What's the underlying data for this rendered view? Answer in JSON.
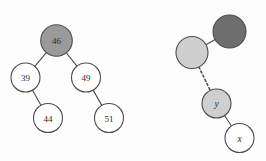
{
  "figure": {
    "background_color": "#fdfdfd",
    "stroke_color": "#4d4d4d",
    "fill_colors": {
      "white": "#ffffff",
      "light_gray": "#cfcfcf",
      "mid_gray": "#9a9a9a",
      "dark_gray": "#6e6e6e"
    }
  },
  "diagrams": [
    {
      "name": "left-tree",
      "kind": "binary-search-tree",
      "nodes": [
        {
          "id": "n46",
          "label": "46",
          "cx": 56.5,
          "cy": 40.5,
          "r": 15.8,
          "fill": "#9a9a9a",
          "label_fill": "#3a3a3a"
        },
        {
          "id": "n39",
          "label": "39",
          "cx": 25.5,
          "cy": 77.5,
          "r": 14.5,
          "fill": "#ffffff",
          "label_fill": "#2b2b2b"
        },
        {
          "id": "n49",
          "label": "49",
          "cx": 86.0,
          "cy": 77.5,
          "r": 14.5,
          "fill": "#ffffff",
          "label_fill": "#2b2b2b"
        },
        {
          "id": "n44",
          "label": "44",
          "cx": 48.0,
          "cy": 118.0,
          "r": 14.5,
          "fill": "#ffffff",
          "label_fill": "#2b2b2b"
        },
        {
          "id": "n51",
          "label": "51",
          "cx": 109.0,
          "cy": 118.0,
          "r": 14.5,
          "fill": "#ffffff",
          "label_fill": "#2b2b2b"
        }
      ],
      "edges": [
        {
          "from": "n46",
          "to": "n39",
          "style": "solid"
        },
        {
          "from": "n46",
          "to": "n49",
          "style": "solid"
        },
        {
          "from": "n39",
          "to": "n44",
          "style": "solid"
        },
        {
          "from": "n49",
          "to": "n51",
          "style": "solid"
        }
      ]
    },
    {
      "name": "right-tree",
      "kind": "abstract-subtree",
      "nodes": [
        {
          "id": "rdark",
          "label": "",
          "cx": 229.5,
          "cy": 31.5,
          "r": 16.5,
          "fill": "#6e6e6e",
          "label_fill": "#2b2b2b"
        },
        {
          "id": "rlight",
          "label": "",
          "cx": 192.0,
          "cy": 52.5,
          "r": 16.0,
          "fill": "#cfcfcf",
          "label_fill": "#2b2b2b"
        },
        {
          "id": "ny",
          "label": "y",
          "cx": 216.5,
          "cy": 103.5,
          "r": 14.5,
          "fill": "#cfcfcf",
          "label_fill": "#2b2b2b",
          "italic": true
        },
        {
          "id": "nx",
          "label": "x",
          "cx": 239.5,
          "cy": 138.0,
          "r": 14.5,
          "fill": "#ffffff",
          "label_fill": "#2b2b2b",
          "italic": true
        }
      ],
      "edges": [
        {
          "from": "rlight",
          "to": "rdark",
          "style": "solid"
        },
        {
          "from": "rlight",
          "to": "ny",
          "style": "dotted"
        },
        {
          "from": "ny",
          "to": "nx",
          "style": "solid"
        }
      ]
    }
  ]
}
